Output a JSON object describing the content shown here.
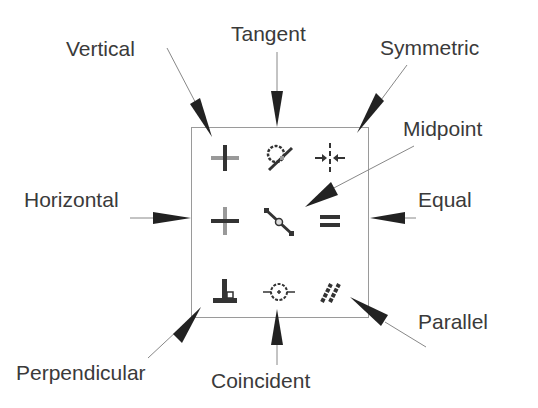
{
  "colors": {
    "icon": "#333333",
    "icon_light": "#999999",
    "arrow": "#222222",
    "leader": "#888888",
    "box_border": "#9a9a9a"
  },
  "labels": {
    "vertical": "Vertical",
    "tangent": "Tangent",
    "symmetric": "Symmetric",
    "midpoint": "Midpoint",
    "horizontal": "Horizontal",
    "equal": "Equal",
    "perpendicular": "Perpendicular",
    "coincident": "Coincident",
    "parallel": "Parallel"
  },
  "icons": [
    {
      "row": 0,
      "col": 0,
      "name": "vertical-icon"
    },
    {
      "row": 0,
      "col": 1,
      "name": "tangent-icon"
    },
    {
      "row": 0,
      "col": 2,
      "name": "symmetric-icon"
    },
    {
      "row": 1,
      "col": 0,
      "name": "horizontal-icon"
    },
    {
      "row": 1,
      "col": 1,
      "name": "midpoint-icon"
    },
    {
      "row": 1,
      "col": 2,
      "name": "equal-icon"
    },
    {
      "row": 2,
      "col": 0,
      "name": "perpendicular-icon"
    },
    {
      "row": 2,
      "col": 1,
      "name": "coincident-icon"
    },
    {
      "row": 2,
      "col": 2,
      "name": "parallel-icon"
    }
  ]
}
